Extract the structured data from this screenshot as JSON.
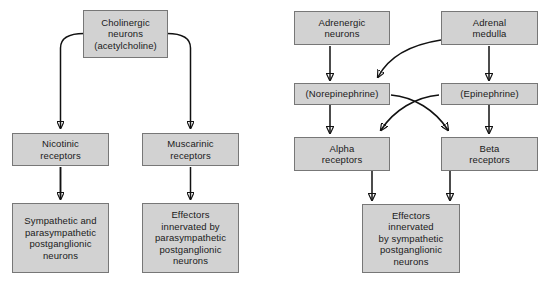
{
  "diagram": {
    "colors": {
      "box_fill": "#d2d2d2",
      "box_border": "#777777",
      "arrow": "#111111",
      "background": "#ffffff",
      "text": "#1a1a1a"
    },
    "panels": {
      "left": {
        "name": "cholinergic-pathway",
        "nodes": {
          "cholinergic_neurons": "Cholinergic\nneurons\n(acetylcholine)",
          "nicotinic_receptors": "Nicotinic\nreceptors",
          "muscarinic_receptors": "Muscarinic\nreceptors",
          "sympathetic_parasympathetic_postganglionic": "Sympathetic and\nparasympathetic\npostganglionic\nneurons",
          "effectors_parasympathetic": "Effectors\ninnervated by\nparasympathetic\npostganglionic\nneurons"
        },
        "edges": [
          {
            "from": "cholinergic_neurons",
            "to": "nicotinic_receptors",
            "style": "elbow-left"
          },
          {
            "from": "cholinergic_neurons",
            "to": "muscarinic_receptors",
            "style": "elbow-right"
          },
          {
            "from": "nicotinic_receptors",
            "to": "sympathetic_parasympathetic_postganglionic",
            "style": "straight"
          },
          {
            "from": "muscarinic_receptors",
            "to": "effectors_parasympathetic",
            "style": "straight"
          }
        ]
      },
      "right": {
        "name": "adrenergic-pathway",
        "nodes": {
          "adrenergic_neurons": "Adrenergic\nneurons",
          "adrenal_medulla": "Adrenal\nmedulla",
          "norepinephrine": "(Norepinephrine)",
          "epinephrine": "(Epinephrine)",
          "alpha_receptors": "Alpha\nreceptors",
          "beta_receptors": "Beta\nreceptors",
          "effectors_sympathetic": "Effectors\ninnervated\nby sympathetic\npostganglionic\nneurons"
        },
        "edges": [
          {
            "from": "adrenergic_neurons",
            "to": "norepinephrine",
            "style": "straight"
          },
          {
            "from": "adrenal_medulla",
            "to": "epinephrine",
            "style": "straight"
          },
          {
            "from": "adrenal_medulla",
            "to": "norepinephrine",
            "style": "curve"
          },
          {
            "from": "norepinephrine",
            "to": "alpha_receptors",
            "style": "straight"
          },
          {
            "from": "norepinephrine",
            "to": "beta_receptors",
            "style": "curve-cross"
          },
          {
            "from": "epinephrine",
            "to": "beta_receptors",
            "style": "straight"
          },
          {
            "from": "epinephrine",
            "to": "alpha_receptors",
            "style": "curve-cross"
          },
          {
            "from": "alpha_receptors",
            "to": "effectors_sympathetic",
            "style": "straight"
          },
          {
            "from": "beta_receptors",
            "to": "effectors_sympathetic",
            "style": "straight"
          }
        ]
      }
    }
  }
}
